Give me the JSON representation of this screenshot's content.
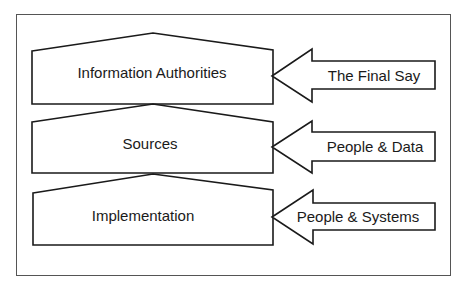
{
  "diagram": {
    "layers": [
      {
        "label": "Information Authorities",
        "arrow_label": "The Final Say"
      },
      {
        "label": "Sources",
        "arrow_label": "People & Data"
      },
      {
        "label": "Implementation",
        "arrow_label": "People & Systems"
      }
    ],
    "colors": {
      "stroke": "#1a1a1a",
      "fill": "#ffffff",
      "frame": "#555555"
    }
  }
}
